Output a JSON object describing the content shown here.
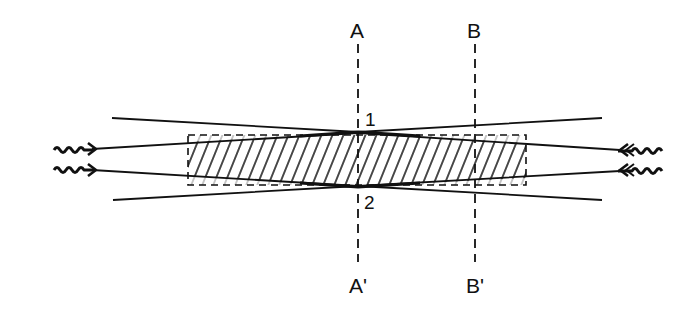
{
  "diagram": {
    "type": "optical beam crossing / hatched medium",
    "colors": {
      "stroke": "#111111",
      "background": "#ffffff"
    },
    "planes": [
      {
        "id": "A",
        "top_label": "A",
        "bottom_label": "A'",
        "x": 358
      },
      {
        "id": "B",
        "top_label": "B",
        "bottom_label": "B'",
        "x": 475
      }
    ],
    "points": [
      {
        "label": "1",
        "position": "upper crossing at plane A"
      },
      {
        "label": "2",
        "position": "lower crossing at plane A"
      }
    ],
    "medium": {
      "shape": "dashed rectangle",
      "fill": "diagonal hatching",
      "x1": 188,
      "y1": 135,
      "x2": 526,
      "y2": 185
    },
    "inputs": [
      {
        "side": "left",
        "icon": "wavy-arrow-right-icon",
        "count": 2
      },
      {
        "side": "right",
        "icon": "wavy-arrow-left-icon",
        "count": 2
      }
    ]
  },
  "labels": {
    "A": "A",
    "A_prime": "A'",
    "B": "B",
    "B_prime": "B'",
    "point1": "1",
    "point2": "2"
  }
}
